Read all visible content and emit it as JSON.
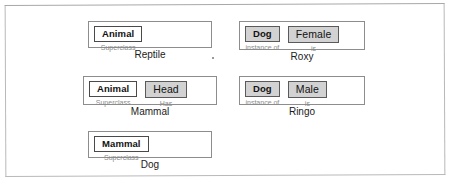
{
  "diagram": {
    "colors": {
      "page_background": "#ffffff",
      "frame_border": "#b9b9b9",
      "card_border": "#8d8d8d",
      "chip_border": "#4a4a4a",
      "chip_shaded_fill": "#d2d2d2",
      "chip_plain_fill": "#ffffff",
      "slot_label_text": "#8b8b8b",
      "caption_text": "#1b1b1b"
    },
    "cards": [
      {
        "id": "reptile",
        "caption": "Reptile",
        "column": "left",
        "slots": [
          {
            "value": "Animal",
            "label": "Superclass",
            "shaded": false
          }
        ]
      },
      {
        "id": "mammal",
        "caption": "Mammal",
        "column": "left",
        "slots": [
          {
            "value": "Animal",
            "label": "Superclass",
            "shaded": false
          },
          {
            "value": "Head",
            "label": "Has",
            "shaded": true
          }
        ]
      },
      {
        "id": "dog",
        "caption": "Dog",
        "column": "left",
        "slots": [
          {
            "value": "Mammal",
            "label": "Superclass",
            "shaded": false
          }
        ]
      },
      {
        "id": "roxy",
        "caption": "Roxy",
        "column": "right",
        "slots": [
          {
            "value": "Dog",
            "label": "instance of",
            "shaded": true
          },
          {
            "value": "Female",
            "label": "is",
            "shaded": true
          }
        ]
      },
      {
        "id": "ringo",
        "caption": "Ringo",
        "column": "right",
        "slots": [
          {
            "value": "Dog",
            "label": "instance of",
            "shaded": true
          },
          {
            "value": "Male",
            "label": "is",
            "shaded": true
          }
        ]
      }
    ]
  }
}
